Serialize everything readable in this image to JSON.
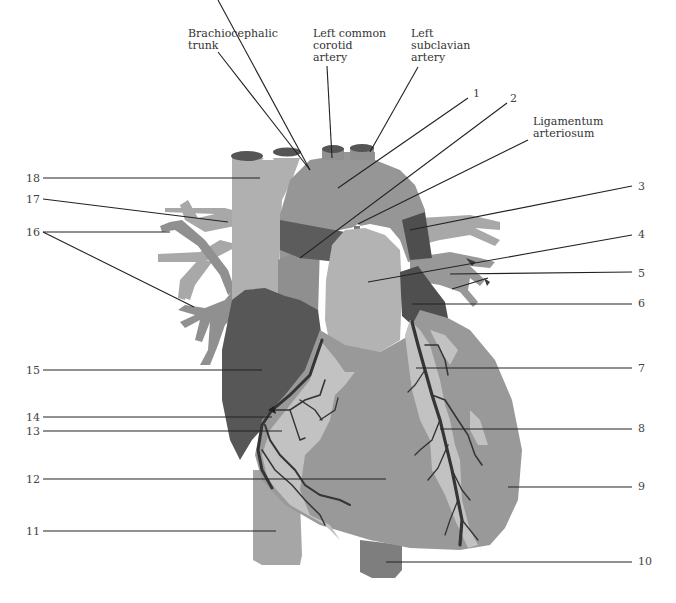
{
  "diagram": {
    "colors": {
      "light": "#b5b5b5",
      "mid": "#9a9a9a",
      "medium_dark": "#888888",
      "dark": "#5e5e5e",
      "vessel_dark": "#3c3c3c",
      "fat_light": "#c4c4c4",
      "leader": "#222222"
    },
    "top_labels": [
      {
        "id": "brachiocephalic",
        "line1": "Brachiocephalic",
        "line2": "trunk",
        "line3": ""
      },
      {
        "id": "left-common-carotid",
        "line1": "Left common",
        "line2": "corotid",
        "line3": "artery"
      },
      {
        "id": "left-subclavian",
        "line1": "Left",
        "line2": "subclavian",
        "line3": "artery"
      },
      {
        "id": "ligamentum",
        "line1": "Ligamentum",
        "line2": "arteriosum",
        "line3": ""
      }
    ],
    "right_numbers": [
      "1",
      "2",
      "3",
      "4",
      "5",
      "6",
      "7",
      "8",
      "9",
      "10"
    ],
    "left_numbers": [
      "18",
      "17",
      "16",
      "15",
      "14",
      "13",
      "12",
      "11"
    ]
  }
}
